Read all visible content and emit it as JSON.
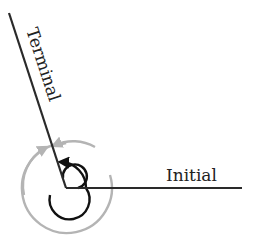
{
  "diagram": {
    "vertex": {
      "x": 66,
      "y": 188
    },
    "initial_side": {
      "label": "Initial",
      "end": {
        "x": 242,
        "y": 188
      }
    },
    "terminal_side": {
      "label": "Terminal",
      "end": {
        "x": 9,
        "y": 13
      }
    },
    "colors": {
      "rays": "#2a2a2a",
      "inner_arc": "#111111",
      "outer_arc": "#b4b4b4",
      "text": "#222222"
    },
    "arcs": [
      {
        "name": "coterminal-small-rotation",
        "description": "black spiral, ~1 revolution + terminal angle"
      },
      {
        "name": "coterminal-large-rotation",
        "description": "gray circle arc with arrows, counterclockwise"
      }
    ]
  }
}
